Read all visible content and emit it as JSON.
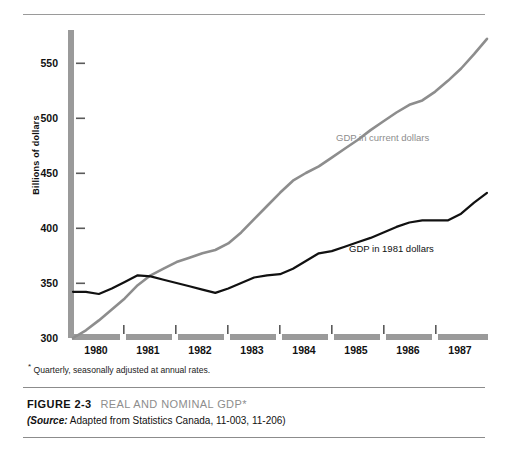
{
  "figure": {
    "number_label": "FIGURE 2-3",
    "title": "REAL AND NOMINAL GDP*",
    "footnote": "Quarterly, seasonally adjusted at annual rates.",
    "footnote_marker": "*",
    "source_prefix": "(Source:",
    "source_text": " Adapted from Statistics Canada, 11-003, 11-206)"
  },
  "colors": {
    "nominal_series": "#8d8d8d",
    "real_series": "#111111",
    "axis_bar": "#9a9a9a",
    "rule": "#8c8c8c",
    "background": "#ffffff"
  },
  "chart_data": {
    "type": "line",
    "title": "REAL AND NOMINAL GDP*",
    "xlabel": "",
    "ylabel": "Billions of dollars",
    "xlim": [
      1979.75,
      1987.75
    ],
    "ylim": [
      300,
      575
    ],
    "yticks": [
      300,
      350,
      400,
      450,
      500,
      550
    ],
    "xticks": [
      1980,
      1981,
      1982,
      1983,
      1984,
      1985,
      1986,
      1987
    ],
    "grid": false,
    "legend_position": "inline-labels",
    "series": [
      {
        "name": "GDP in current dollars",
        "color": "#8d8d8d",
        "x": [
          1979.75,
          1980.0,
          1980.25,
          1980.5,
          1980.75,
          1981.0,
          1981.25,
          1981.5,
          1981.75,
          1982.0,
          1982.25,
          1982.5,
          1982.75,
          1983.0,
          1983.25,
          1983.5,
          1983.75,
          1984.0,
          1984.25,
          1984.5,
          1984.75,
          1985.0,
          1985.25,
          1985.5,
          1985.75,
          1986.0,
          1986.25,
          1986.5,
          1986.75,
          1987.0,
          1987.25,
          1987.5,
          1987.75
        ],
        "values": [
          300,
          307,
          316,
          326,
          336,
          348,
          357,
          363,
          369,
          373,
          377,
          380,
          386,
          396,
          408,
          420,
          432,
          443,
          450,
          456,
          464,
          472,
          480,
          489,
          497,
          505,
          512,
          516,
          524,
          534,
          545,
          558,
          572
        ]
      },
      {
        "name": "GDP in 1981 dollars",
        "color": "#111111",
        "x": [
          1979.75,
          1980.0,
          1980.25,
          1980.5,
          1980.75,
          1981.0,
          1981.25,
          1981.5,
          1981.75,
          1982.0,
          1982.25,
          1982.5,
          1982.75,
          1983.0,
          1983.25,
          1983.5,
          1983.75,
          1984.0,
          1984.25,
          1984.5,
          1984.75,
          1985.0,
          1985.25,
          1985.5,
          1985.75,
          1986.0,
          1986.25,
          1986.5,
          1986.75,
          1987.0,
          1987.25,
          1987.5,
          1987.75
        ],
        "values": [
          342,
          342,
          340,
          345,
          351,
          357,
          356,
          353,
          350,
          347,
          344,
          341,
          345,
          350,
          355,
          357,
          358,
          363,
          370,
          377,
          379,
          383,
          387,
          391,
          396,
          401,
          405,
          407,
          407,
          407,
          413,
          423,
          432
        ]
      }
    ],
    "series_labels": [
      {
        "text": "GDP in current dollars",
        "color": "#8d8d8d"
      },
      {
        "text": "GDP in 1981 dollars",
        "color": "#111111"
      }
    ]
  },
  "axis": {
    "y_title": "Billions of dollars",
    "y_tick_labels": [
      "550",
      "500",
      "450",
      "400",
      "350",
      "300"
    ],
    "x_tick_labels": [
      "1980",
      "1981",
      "1982",
      "1983",
      "1984",
      "1985",
      "1986",
      "1987"
    ]
  }
}
